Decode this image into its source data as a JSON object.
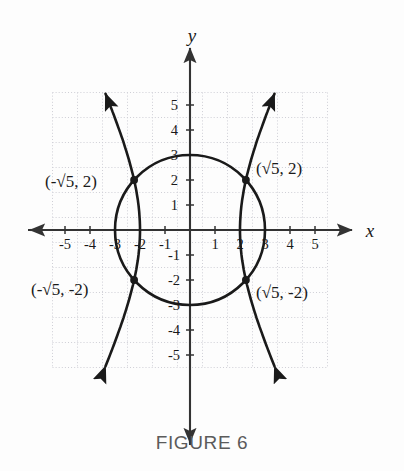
{
  "caption": "FIGURE 6",
  "axes": {
    "x_label": "x",
    "y_label": "y",
    "x_ticks": [
      "-5",
      "-4",
      "-3",
      "-2",
      "-1",
      "1",
      "2",
      "3",
      "4",
      "5"
    ],
    "y_ticks": [
      "5",
      "4",
      "3",
      "2",
      "1",
      "-1",
      "-2",
      "-3",
      "-4",
      "-5"
    ]
  },
  "point_labels": {
    "top_left": "(-√5, 2)",
    "top_right": "(√5, 2)",
    "bottom_left": "(-√5, -2)",
    "bottom_right": "(√5, -2)"
  },
  "colors": {
    "curve": "#1a1a1a",
    "axis": "#333333",
    "grid": "#cfcfd6",
    "caption": "#5b5b5b",
    "background": "#fdfdfd"
  },
  "chart_data": {
    "type": "line",
    "title": "FIGURE 6",
    "xlabel": "x",
    "ylabel": "y",
    "xlim": [
      -5.5,
      5.5
    ],
    "ylim": [
      -5.5,
      5.5
    ],
    "grid": true,
    "legend": "none",
    "xticks": [
      -5,
      -4,
      -3,
      -2,
      -1,
      1,
      2,
      3,
      4,
      5
    ],
    "yticks": [
      5,
      4,
      3,
      2,
      1,
      -1,
      -2,
      -3,
      -4,
      -5
    ],
    "series": [
      {
        "name": "circle",
        "equation": "x^2 + y^2 = 9",
        "shape": "circle",
        "center": [
          0,
          0
        ],
        "radius": 3
      },
      {
        "name": "hyperbola",
        "equation": "x^2/4 - y^2/16 = 1",
        "shape": "hyperbola",
        "a": 2,
        "b": 4,
        "vertices": [
          [
            -2,
            0
          ],
          [
            2,
            0
          ]
        ],
        "asymptote_slopes": [
          2,
          -2
        ],
        "arrows": "both-branches-both-ends"
      }
    ],
    "intersections": [
      {
        "x": -2.2360679,
        "y": 2,
        "label": "(-√5, 2)"
      },
      {
        "x": 2.2360679,
        "y": 2,
        "label": "(√5, 2)"
      },
      {
        "x": -2.2360679,
        "y": -2,
        "label": "(-√5, -2)"
      },
      {
        "x": 2.2360679,
        "y": -2,
        "label": "(√5, -2)"
      }
    ],
    "annotations": [
      {
        "text": "(-√5, 2)",
        "x": -4.6,
        "y": 2.35
      },
      {
        "text": "(√5, 2)",
        "x": 2.55,
        "y": 2.45
      },
      {
        "text": "(-√5, -2)",
        "x": -5.1,
        "y": -2.55
      },
      {
        "text": "(√5, -2)",
        "x": 2.55,
        "y": -2.6
      }
    ]
  }
}
